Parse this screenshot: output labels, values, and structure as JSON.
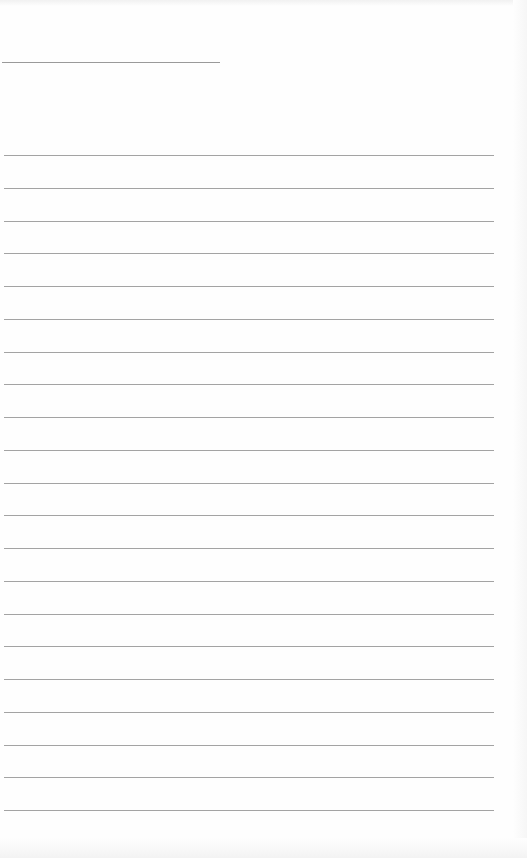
{
  "document": {
    "type": "lined-paper",
    "title_line": {
      "top": 62,
      "left": 2,
      "width": 218
    },
    "ruled_lines": {
      "count": 21,
      "first_top": 155,
      "spacing": 32.75,
      "left": 4,
      "width": 490,
      "color": "#a3a3a3"
    },
    "text": []
  }
}
